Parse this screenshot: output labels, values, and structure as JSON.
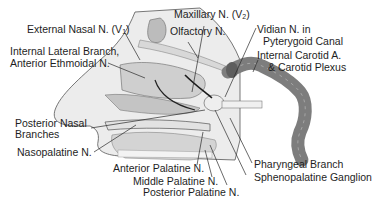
{
  "diagram": {
    "type": "anatomical-illustration",
    "labels": {
      "external_nasal": {
        "text": "External Nasal N. (V",
        "sub": "1",
        "suffix": ")"
      },
      "internal_lateral_1": "Internal Lateral Branch,",
      "internal_lateral_2": "Anterior Ethmoidal N.",
      "maxillary": {
        "text": "Maxillary N. (V",
        "sub": "2",
        "suffix": ")"
      },
      "olfactory": "Olfactory N.",
      "vidian_1": "Vidian N. in",
      "vidian_2": "Pyterygoid Canal",
      "carotid_1": "Internal Carotid A.",
      "carotid_2": "& Carotid Plexus",
      "posterior_nasal_1": "Posterior Nasal",
      "posterior_nasal_2": "Branches",
      "nasopalatine": "Nasopalatine N.",
      "anterior_palatine": "Anterior Palatine N.",
      "middle_palatine": "Middle Palatine N.",
      "posterior_palatine": "Posterior Palatine N.",
      "pharyngeal": "Pharyngeal Branch",
      "sphenopalatine": "Sphenopalatine Ganglion"
    },
    "colors": {
      "line": "#2a2a2a",
      "tissue_light": "#e6e6e6",
      "tissue_mid": "#bdbdbd",
      "vessel": "#7d7d7d"
    }
  }
}
